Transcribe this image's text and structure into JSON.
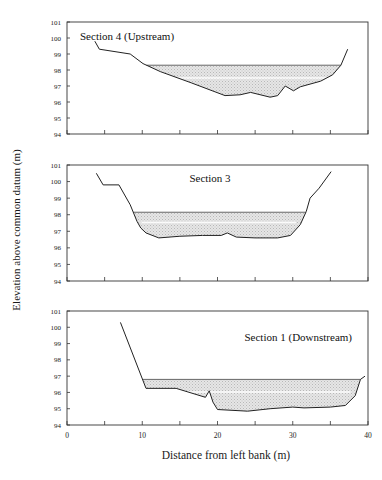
{
  "figure": {
    "y_axis_label": "Elevation above common datum (m)",
    "x_axis_label": "Distance from left bank (m)",
    "caption_fragment": "Plan 1  ...   f (   l   )"
  },
  "chart_data": [
    {
      "type": "area",
      "title": "Section 4 (Upstream)",
      "xlabel": "Distance from left bank (m)",
      "ylabel": "Elevation above common datum (m)",
      "xlim": [
        0,
        40
      ],
      "ylim": [
        94,
        101
      ],
      "x_ticks": [
        0,
        5,
        10,
        15,
        20,
        25,
        30,
        35,
        40
      ],
      "y_ticks": [
        94,
        95,
        96,
        97,
        98,
        99,
        100,
        101
      ],
      "grid": false,
      "water_level": 98.3,
      "bed_profile": {
        "x": [
          3.7,
          4.3,
          8.4,
          10.1,
          12.4,
          16.5,
          21.0,
          23.0,
          24.4,
          27.0,
          28.0,
          29.0,
          30.1,
          31.0,
          33.7,
          35.3,
          36.4,
          37.3
        ],
        "y": [
          99.8,
          99.3,
          99.0,
          98.4,
          97.9,
          97.2,
          96.4,
          96.45,
          96.6,
          96.3,
          96.4,
          97.0,
          96.7,
          96.95,
          97.3,
          97.7,
          98.3,
          99.3
        ]
      }
    },
    {
      "type": "area",
      "title": "Section 3",
      "xlabel": "Distance from left bank (m)",
      "ylabel": "Elevation above common datum (m)",
      "xlim": [
        0,
        40
      ],
      "ylim": [
        94,
        101
      ],
      "x_ticks": [
        0,
        5,
        10,
        15,
        20,
        25,
        30,
        35,
        40
      ],
      "y_ticks": [
        94,
        95,
        96,
        97,
        98,
        99,
        100,
        101
      ],
      "grid": false,
      "water_level": 98.15,
      "bed_profile": {
        "x": [
          3.9,
          4.8,
          6.9,
          8.4,
          9.3,
          9.8,
          10.5,
          12.2,
          15.0,
          18.0,
          20.5,
          21.3,
          22.5,
          25.0,
          28.0,
          29.7,
          31.0,
          31.8,
          32.3,
          33.5,
          35.1
        ],
        "y": [
          100.5,
          99.8,
          99.8,
          98.6,
          97.6,
          97.2,
          96.9,
          96.6,
          96.7,
          96.75,
          96.75,
          96.9,
          96.65,
          96.6,
          96.6,
          96.75,
          97.4,
          98.2,
          99.0,
          99.6,
          100.6
        ]
      }
    },
    {
      "type": "area",
      "title": "Section 1 (Downstream)",
      "xlabel": "Distance from left bank (m)",
      "ylabel": "Elevation above common datum (m)",
      "xlim": [
        0,
        40
      ],
      "ylim": [
        94,
        101
      ],
      "x_ticks": [
        0,
        5,
        10,
        15,
        20,
        25,
        30,
        35,
        40
      ],
      "x_tick_labels": [
        "0",
        "10",
        "20",
        "30",
        "40"
      ],
      "y_ticks": [
        94,
        95,
        96,
        97,
        98,
        99,
        100,
        101
      ],
      "grid": false,
      "water_level": 96.8,
      "bed_profile": {
        "x": [
          7.1,
          10.5,
          14.5,
          18.4,
          18.9,
          19.4,
          20.0,
          24.0,
          27.0,
          30.0,
          31.5,
          35.0,
          37.0,
          38.3,
          39.0,
          39.6
        ],
        "y": [
          100.3,
          96.25,
          96.25,
          95.7,
          96.1,
          95.4,
          94.95,
          94.85,
          95.0,
          95.1,
          95.05,
          95.1,
          95.2,
          95.8,
          96.8,
          97.0
        ]
      }
    }
  ]
}
